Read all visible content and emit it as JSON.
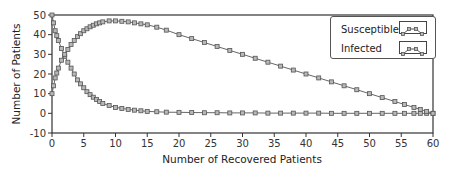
{
  "chart_data": {
    "type": "line",
    "title": "",
    "xlabel": "Number of Recovered Patients",
    "ylabel": "Number of Patients",
    "xlim": [
      0,
      60
    ],
    "ylim": [
      -10,
      50
    ],
    "xticks": [
      0,
      5,
      10,
      15,
      20,
      25,
      30,
      35,
      40,
      45,
      50,
      55,
      60
    ],
    "yticks": [
      -10,
      0,
      10,
      20,
      30,
      40,
      50
    ],
    "grid": false,
    "legend_position": "upper right",
    "markers": "square",
    "series": [
      {
        "name": "Susceptible",
        "x": [
          0,
          0.25,
          0.5,
          0.75,
          1,
          1.5,
          2,
          2.5,
          3,
          3.5,
          4,
          4.5,
          5,
          5.5,
          6,
          6.5,
          7,
          7.5,
          8,
          9,
          10,
          11,
          12,
          13,
          14,
          15,
          16.5,
          18,
          20,
          22,
          24,
          26,
          28,
          30,
          32,
          34,
          36,
          38,
          40,
          42,
          44,
          46,
          48,
          50,
          52,
          54,
          55.5,
          57,
          58,
          59,
          60
        ],
        "values": [
          50,
          46,
          42,
          39.5,
          37,
          33,
          29,
          26,
          23,
          20,
          17,
          15,
          13,
          11,
          9.5,
          8.2,
          7,
          6,
          5,
          4,
          3,
          2.5,
          2,
          1.6,
          1.3,
          1,
          0.8,
          0.6,
          0.5,
          0.4,
          0.3,
          0.3,
          0.2,
          0.2,
          0.2,
          0.1,
          0.1,
          0.1,
          0.1,
          0.1,
          0,
          0,
          0,
          0,
          0,
          0,
          0,
          0,
          0,
          0,
          0
        ]
      },
      {
        "name": "Infected",
        "x": [
          0,
          0.25,
          0.5,
          0.75,
          1,
          1.5,
          2,
          2.5,
          3,
          3.5,
          4,
          4.5,
          5,
          5.5,
          6,
          6.5,
          7,
          7.5,
          8,
          9,
          10,
          11,
          12,
          13,
          14,
          15,
          16.5,
          18,
          20,
          22,
          24,
          26,
          28,
          30,
          32,
          34,
          36,
          38,
          40,
          42,
          44,
          46,
          48,
          50,
          52,
          54,
          55.5,
          57,
          58,
          59,
          60
        ],
        "values": [
          10,
          14,
          18,
          20.5,
          23,
          27,
          30,
          32.5,
          35,
          37,
          39,
          40.5,
          42,
          43,
          44,
          44.8,
          45.5,
          46,
          46.5,
          47,
          47,
          46.8,
          46.5,
          46,
          45.5,
          45,
          43.8,
          42.3,
          40,
          38,
          36,
          34,
          32,
          30,
          28,
          26,
          24,
          22,
          20,
          18,
          16,
          14,
          12,
          10,
          8,
          6,
          4.5,
          3,
          2,
          1,
          0
        ]
      }
    ]
  },
  "legend": {
    "items": [
      {
        "label": "Susceptible",
        "icon": "line-with-square-markers-icon"
      },
      {
        "label": "Infected",
        "icon": "line-with-square-markers-icon"
      }
    ]
  },
  "colors": {
    "line": "#666666",
    "marker_fill": "#b8b8b8",
    "marker_stroke": "#555555",
    "axis": "#333333"
  }
}
